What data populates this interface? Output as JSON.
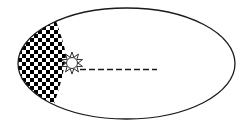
{
  "diagram": {
    "type": "orbital-ellipse",
    "colors": {
      "background": "#ffffff",
      "stroke": "#1a1a1a",
      "checker_dark": "#000000",
      "checker_light": "#ffffff",
      "sun_fill": "#ffffff"
    },
    "orbit": {
      "cx": 126.5,
      "cy": 63.5,
      "rx": 108.5,
      "ry": 55.5
    },
    "sun": {
      "cx": 72,
      "cy": 63,
      "radius": 5.5,
      "ray_outer_radius": 11,
      "ray_count": 10,
      "icon": "sun-icon"
    },
    "swept_area": {
      "pattern": "checkerboard",
      "cell_size": 4
    },
    "dashed_line": {
      "x1": 80,
      "y1": 69.5,
      "x2": 157,
      "y2": 69.5,
      "dash": 6,
      "gap": 3
    }
  }
}
